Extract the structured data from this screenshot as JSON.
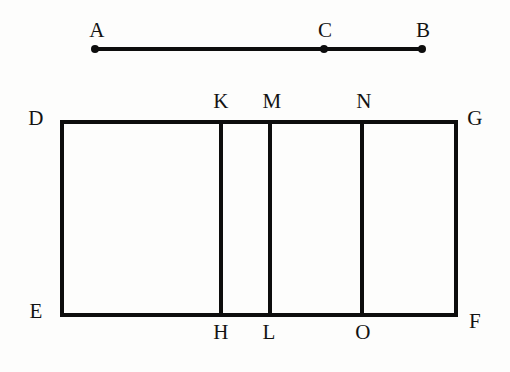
{
  "figure": {
    "type": "geometry-diagram",
    "width": 510,
    "height": 372,
    "background_color": "#fdfdfc",
    "stroke_color": "#0d0d0d"
  },
  "segment": {
    "name": "AB",
    "endpoints": {
      "left_label": "A",
      "right_label": "B"
    },
    "interior_point_label": "C",
    "labels": {
      "a": "A",
      "b": "B",
      "c": "C"
    }
  },
  "rectangle": {
    "name": "DEFG",
    "corners": {
      "top_left": "D",
      "top_right": "G",
      "bottom_left": "E",
      "bottom_right": "F"
    }
  },
  "dividers": [
    {
      "top_label": "K",
      "bottom_label": "H"
    },
    {
      "top_label": "M",
      "bottom_label": "L"
    },
    {
      "top_label": "N",
      "bottom_label": "O"
    }
  ],
  "labels": {
    "a": "A",
    "b": "B",
    "c": "C",
    "d": "D",
    "e": "E",
    "f": "F",
    "g": "G",
    "h": "H",
    "k": "K",
    "l": "L",
    "m": "M",
    "n": "N",
    "o": "O"
  }
}
